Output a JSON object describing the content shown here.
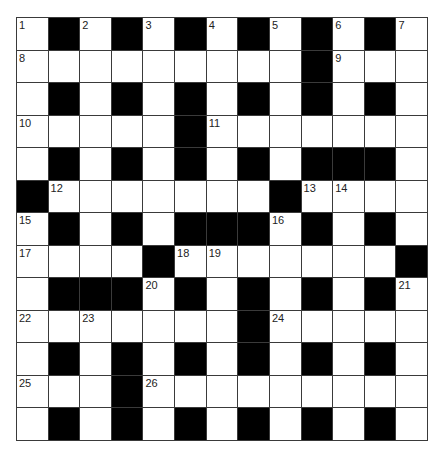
{
  "puzzle": {
    "rows": 13,
    "cols": 13,
    "colors": {
      "block": "#000000",
      "cell": "#ffffff",
      "line": "#3a3a3a",
      "number": "#222222"
    },
    "grid": [
      "1#2#3#4#5#6#7",
      "8........#9..",
      ".#.#.#.#.#.#.",
      "10....#11......",
      ".#.#.#.#.###.",
      "#12......#1314..",
      "15#.#.###16#.#.",
      "17...#1819.....#",
      ".###20#.#.#.#21",
      "22.23....#24....",
      ".#.#.#.#.#.#.",
      "25..#26........",
      ".#.#.#.#.#.#."
    ],
    "cells": [
      [
        "1",
        "#",
        "2",
        "#",
        "3",
        "#",
        "4",
        "#",
        "5",
        "#",
        "6",
        "#",
        "7"
      ],
      [
        "8",
        "",
        "",
        "",
        "",
        "",
        "",
        "",
        "",
        "#",
        "9",
        "",
        ""
      ],
      [
        "",
        "#",
        "",
        "#",
        "",
        "#",
        "",
        "#",
        "",
        "#",
        "",
        "#",
        ""
      ],
      [
        "10",
        "",
        "",
        "",
        "",
        "#",
        "11",
        "",
        "",
        "",
        "",
        "",
        ""
      ],
      [
        "",
        "#",
        "",
        "#",
        "",
        "#",
        "",
        "#",
        "",
        "#",
        "#",
        "#",
        ""
      ],
      [
        "#",
        "12",
        "",
        "",
        "",
        "",
        "",
        "",
        "#",
        "13",
        "14",
        "",
        ""
      ],
      [
        "15",
        "#",
        "",
        "#",
        "",
        "#",
        "#",
        "#",
        "16",
        "#",
        "",
        "#",
        ""
      ],
      [
        "17",
        "",
        "",
        "",
        "#",
        "18",
        "19",
        "",
        "",
        "",
        "",
        "",
        "#"
      ],
      [
        "",
        "#",
        "#",
        "#",
        "20",
        "#",
        "",
        "#",
        "",
        "#",
        "",
        "#",
        "21"
      ],
      [
        "22",
        "",
        "23",
        "",
        "",
        "",
        "",
        "#",
        "24",
        "",
        "",
        "",
        ""
      ],
      [
        "",
        "#",
        "",
        "#",
        "",
        "#",
        "",
        "#",
        "",
        "#",
        "",
        "#",
        ""
      ],
      [
        "25",
        "",
        "",
        "#",
        "26",
        "",
        "",
        "",
        "",
        "",
        "",
        "",
        ""
      ],
      [
        "",
        "#",
        "",
        "#",
        "",
        "#",
        "",
        "#",
        "",
        "#",
        "",
        "#",
        ""
      ]
    ]
  }
}
